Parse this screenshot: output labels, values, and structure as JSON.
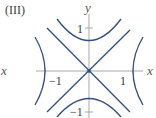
{
  "panel_label": "(III)",
  "axes": {
    "x_label": "x",
    "y_label": "y",
    "x_ticks": [
      "−1",
      "1"
    ],
    "y_ticks": [
      "1",
      "−1"
    ]
  },
  "colors": {
    "curve": "#2f4f7f",
    "axis": "#a8a8a8",
    "text": "#3a3a3a"
  },
  "curves": [
    {
      "name": "line y = x",
      "type": "line"
    },
    {
      "name": "line y = -x",
      "type": "line"
    },
    {
      "name": "upper hyperbola branch",
      "type": "hyperbola",
      "vertex": [
        0,
        0.67
      ]
    },
    {
      "name": "lower hyperbola branch",
      "type": "hyperbola",
      "vertex": [
        0,
        -0.67
      ]
    },
    {
      "name": "left hyperbola branch",
      "type": "hyperbola",
      "vertex": [
        -1,
        0
      ]
    },
    {
      "name": "right hyperbola branch",
      "type": "hyperbola",
      "vertex": [
        1,
        0
      ]
    }
  ]
}
